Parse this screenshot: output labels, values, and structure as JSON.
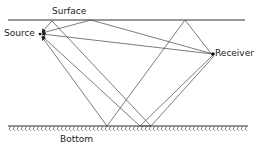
{
  "labels": {
    "surface": "Surface",
    "source": "Source",
    "receiver": "Receiver",
    "bottom": "Bottom"
  },
  "colors": {
    "line": "#333333",
    "ray": "#555555"
  },
  "geometry": {
    "surface_y": 20,
    "bottom_y": 126,
    "source": [
      40,
      34
    ],
    "receiver": [
      213,
      54
    ]
  }
}
